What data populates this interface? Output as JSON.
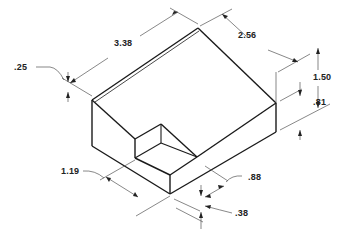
{
  "figure": {
    "line_color": "#1a1a1a",
    "dimension_color": "#555555",
    "background": "#ffffff"
  },
  "dimensions": {
    "length": {
      "label": "3.38"
    },
    "width": {
      "label": "2.56"
    },
    "height_total": {
      "label": "1.50"
    },
    "height_step": {
      "label": ".81"
    },
    "ledge": {
      "label": ".25"
    },
    "notch_length": {
      "label": "1.19"
    },
    "notch_depth": {
      "label": ".88"
    },
    "notch_offset": {
      "label": ".38"
    }
  }
}
